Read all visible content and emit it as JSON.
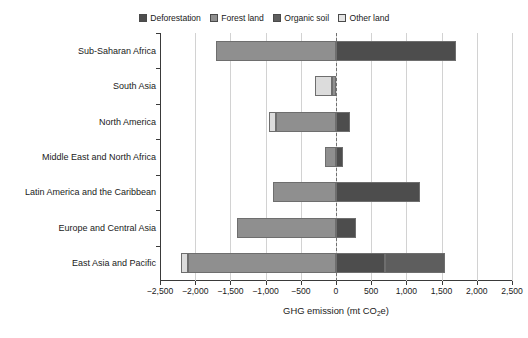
{
  "chart_data": {
    "type": "bar",
    "orientation": "horizontal",
    "stacked": true,
    "title": "",
    "xlabel": "GHG emission (mt CO2e)",
    "xlabel_parts": {
      "pre": "GHG emission (mt CO",
      "sub": "2",
      "post": "e)"
    },
    "ylabel": "",
    "xlim": [
      -2500,
      2500
    ],
    "xticks": [
      -2500,
      -2000,
      -1500,
      -1000,
      -500,
      0,
      500,
      1000,
      1500,
      2000,
      2500
    ],
    "xticklabels": [
      "−2,500",
      "−2,000",
      "−1,500",
      "−1,000",
      "−500",
      "0",
      "500",
      "1,000",
      "1,500",
      "2,000",
      "2,500"
    ],
    "grid": true,
    "zero_reference_line": true,
    "legend_position": "top",
    "categories": [
      "Sub-Saharan Africa",
      "South Asia",
      "North America",
      "Middle East and North Africa",
      "Latin America and the Caribbean",
      "Europe and Central Asia",
      "East Asia and Pacific"
    ],
    "series": [
      {
        "name": "Deforestation",
        "color": "#4d4d4d",
        "values": [
          1700,
          0,
          200,
          100,
          1200,
          290,
          700
        ]
      },
      {
        "name": "Forest land",
        "color": "#8f8f8f",
        "values": [
          -1700,
          -60,
          -850,
          -150,
          -900,
          -1400,
          -2100
        ]
      },
      {
        "name": "Organic soil",
        "color": "#5e5e5e",
        "values": [
          0,
          0,
          0,
          0,
          0,
          0,
          850
        ]
      },
      {
        "name": "Other land",
        "color": "#dcdcdc",
        "values": [
          0,
          -300,
          -950,
          0,
          0,
          0,
          -2200
        ]
      }
    ],
    "bars": [
      {
        "category": "Sub-Saharan Africa",
        "segments": [
          {
            "series": "Forest land",
            "from": -1700,
            "to": 0
          },
          {
            "series": "Deforestation",
            "from": 0,
            "to": 1700
          }
        ]
      },
      {
        "category": "South Asia",
        "segments": [
          {
            "series": "Other land",
            "from": -300,
            "to": -60
          },
          {
            "series": "Forest land",
            "from": -60,
            "to": 0
          }
        ]
      },
      {
        "category": "North America",
        "segments": [
          {
            "series": "Other land",
            "from": -950,
            "to": -850
          },
          {
            "series": "Forest land",
            "from": -850,
            "to": 0
          },
          {
            "series": "Deforestation",
            "from": 0,
            "to": 200
          }
        ]
      },
      {
        "category": "Middle East and North Africa",
        "segments": [
          {
            "series": "Forest land",
            "from": -150,
            "to": 0
          },
          {
            "series": "Deforestation",
            "from": 0,
            "to": 100
          }
        ]
      },
      {
        "category": "Latin America and the Caribbean",
        "segments": [
          {
            "series": "Forest land",
            "from": -900,
            "to": 0
          },
          {
            "series": "Deforestation",
            "from": 0,
            "to": 1200
          }
        ]
      },
      {
        "category": "Europe and Central Asia",
        "segments": [
          {
            "series": "Forest land",
            "from": -1400,
            "to": 0
          },
          {
            "series": "Deforestation",
            "from": 0,
            "to": 290
          }
        ]
      },
      {
        "category": "East Asia and Pacific",
        "segments": [
          {
            "series": "Other land",
            "from": -2200,
            "to": -2100
          },
          {
            "series": "Forest land",
            "from": -2100,
            "to": 0
          },
          {
            "series": "Deforestation",
            "from": 0,
            "to": 700
          },
          {
            "series": "Organic soil",
            "from": 700,
            "to": 1550
          }
        ]
      }
    ]
  },
  "legend": {
    "items": [
      {
        "label": "Deforestation",
        "color": "#4d4d4d"
      },
      {
        "label": "Forest land",
        "color": "#8f8f8f"
      },
      {
        "label": "Organic soil",
        "color": "#5e5e5e"
      },
      {
        "label": "Other land",
        "color": "#e4e4e4"
      }
    ]
  },
  "colors": {
    "deforestation": "#4d4d4d",
    "forest_land": "#8f8f8f",
    "organic_soil": "#5e5e5e",
    "other_land": "#e4e4e4",
    "grid": "#d2d2d2",
    "axis": "#3a3a3a",
    "zero_line": "#707070",
    "background": "#ffffff"
  }
}
